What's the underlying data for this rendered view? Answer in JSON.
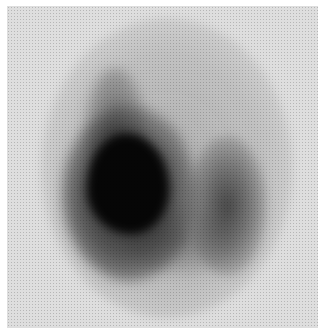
{
  "image": {
    "description": "Grayscale scintigraphy-style nuclear medicine scan showing an oval field with a dark, intense left lobe and a fainter right lobe",
    "colors": {
      "page_background": "#ffffff",
      "panel_background": "#dedede",
      "halo": "#bcbcbc",
      "hot_spot": "#060606",
      "right_lobe": "#4a4a4a"
    },
    "regions": [
      {
        "name": "left-lobe",
        "intensity": "very high",
        "center": [
          120,
          190
        ]
      },
      {
        "name": "right-lobe",
        "intensity": "moderate",
        "center": [
          222,
          210
        ]
      },
      {
        "name": "upper-tail",
        "intensity": "low",
        "center": [
          110,
          100
        ]
      }
    ]
  }
}
